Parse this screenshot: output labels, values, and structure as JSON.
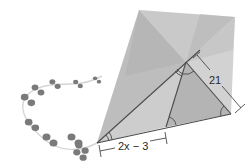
{
  "figure": {
    "labels": {
      "side_length": "21",
      "base_segment": "2x − 3"
    },
    "colors": {
      "kite_light": "#cfcfcf",
      "kite_mid": "#bdbdbd",
      "kite_dark": "#a8a8a8",
      "line": "#4a4a4a",
      "bow": "#7a7a7a",
      "tail": "#d6d6d6"
    },
    "angle_marks": {
      "double_arc_count": 2,
      "single_arc_count": 3
    },
    "tail_bow_count": 10
  }
}
